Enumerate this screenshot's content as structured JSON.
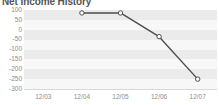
{
  "chart": {
    "title": "Net Income History",
    "line_color": "#4d4d4d",
    "marker_fill": "#ffffff",
    "marker_stroke": "#4d4d4d",
    "band_color": "#ebebeb",
    "band_alt_color": "#f7f7f7",
    "axis_text_color": "#8c8c8c"
  },
  "chart_data": {
    "type": "line",
    "title": "Net Income History",
    "xlabel": "",
    "ylabel": "",
    "categories": [
      "12/03",
      "12/04",
      "12/05",
      "12/06",
      "12/07"
    ],
    "series": [
      {
        "name": "Net Income",
        "values": [
          null,
          85,
          85,
          -35,
          -250
        ]
      }
    ],
    "ylim": [
      -300,
      100
    ],
    "yticks": [
      100,
      50,
      0,
      -50,
      -100,
      -150,
      -200,
      -250,
      -300
    ],
    "ytick_labels": [
      "100",
      "50",
      "0",
      "-50",
      "-100",
      "-150",
      "-200",
      "-250",
      "-300"
    ],
    "xticks": [
      "12/03",
      "12/04",
      "12/05",
      "12/06",
      "12/07"
    ],
    "grid": true,
    "grid_style": "alternating-horizontal-bands",
    "legend": false,
    "markers": "circle"
  }
}
